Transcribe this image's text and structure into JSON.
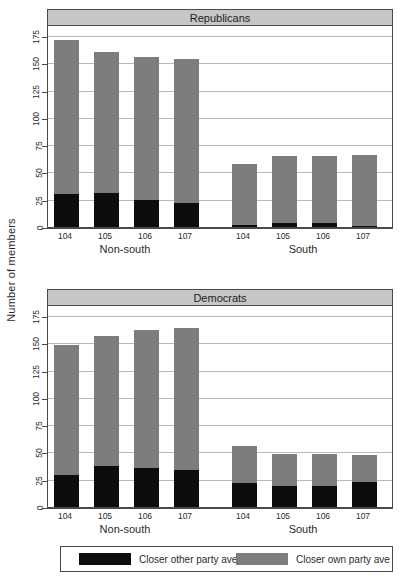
{
  "axis_title": "Number of members",
  "legend": {
    "items": [
      {
        "label": "Closer other party ave",
        "color": "#0d0d0d",
        "key": "other"
      },
      {
        "label": "Closer own party ave",
        "color": "#7d7d7d",
        "key": "own"
      }
    ]
  },
  "panels": [
    {
      "id": "rep",
      "title": "Republicans"
    },
    {
      "id": "dem",
      "title": "Democrats"
    }
  ],
  "groups": [
    {
      "label": "Non-south"
    },
    {
      "label": "South"
    }
  ],
  "chart_data": {
    "type": "bar",
    "xlabel": "",
    "ylabel": "Number of members",
    "ylim": [
      0,
      185
    ],
    "yticks": [
      0,
      25,
      50,
      75,
      100,
      125,
      150,
      175
    ],
    "grid": true,
    "stacked": true,
    "legend_position": "bottom",
    "categories": [
      "104",
      "105",
      "106",
      "107"
    ],
    "groups": [
      "Non-south",
      "South"
    ],
    "panels": [
      {
        "name": "Republicans",
        "groups": [
          {
            "name": "Non-south",
            "categories": [
              "104",
              "105",
              "106",
              "107"
            ],
            "series": [
              {
                "name": "Closer other party ave",
                "values": [
                  30,
                  31,
                  25,
                  22
                ]
              },
              {
                "name": "Closer own party ave",
                "values": [
                  141,
                  129,
                  131,
                  132
                ]
              }
            ],
            "totals": [
              171,
              160,
              156,
              154
            ]
          },
          {
            "name": "South",
            "categories": [
              "104",
              "105",
              "106",
              "107"
            ],
            "series": [
              {
                "name": "Closer other party ave",
                "values": [
                  2,
                  4,
                  4,
                  1
                ]
              },
              {
                "name": "Closer own party ave",
                "values": [
                  56,
                  61,
                  61,
                  65
                ]
              }
            ],
            "totals": [
              58,
              65,
              65,
              66
            ]
          }
        ]
      },
      {
        "name": "Democrats",
        "groups": [
          {
            "name": "Non-south",
            "categories": [
              "104",
              "105",
              "106",
              "107"
            ],
            "series": [
              {
                "name": "Closer other party ave",
                "values": [
                  29,
                  38,
                  36,
                  34
                ]
              },
              {
                "name": "Closer own party ave",
                "values": [
                  119,
                  119,
                  126,
                  130
                ]
              }
            ],
            "totals": [
              148,
              157,
              162,
              164
            ]
          },
          {
            "name": "South",
            "categories": [
              "104",
              "105",
              "106",
              "107"
            ],
            "series": [
              {
                "name": "Closer other party ave",
                "values": [
                  22,
                  19,
                  19,
                  23
                ]
              },
              {
                "name": "Closer own party ave",
                "values": [
                  34,
                  30,
                  30,
                  25
                ]
              }
            ],
            "totals": [
              56,
              49,
              49,
              48
            ]
          }
        ]
      }
    ]
  }
}
